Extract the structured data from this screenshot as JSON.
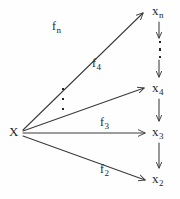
{
  "diagram": {
    "type": "commutative-diagram",
    "stroke_color": "#3a3a3a",
    "text_color": "#262626",
    "background_color": "#fefefe",
    "source_node": {
      "name": "source-node",
      "base": "X",
      "sub": ""
    },
    "target_nodes": [
      {
        "name": "node-xn",
        "base": "x",
        "sub": "n"
      },
      {
        "name": "node-x4",
        "base": "x",
        "sub": "4"
      },
      {
        "name": "node-x3",
        "base": "x",
        "sub": "3"
      },
      {
        "name": "node-x2",
        "base": "x",
        "sub": "2"
      }
    ],
    "edge_labels": [
      {
        "name": "label-fn",
        "base": "f",
        "sub": "n"
      },
      {
        "name": "label-f4",
        "base": "f",
        "sub": "4"
      },
      {
        "name": "label-f3",
        "base": "f",
        "sub": "3"
      },
      {
        "name": "label-f2",
        "base": "f",
        "sub": "2"
      }
    ],
    "ellipses": [
      {
        "name": "fan-ellipsis",
        "orientation": "vertical",
        "dot_count": 3
      },
      {
        "name": "chain-ellipsis",
        "orientation": "vertical",
        "dot_count": 3
      }
    ]
  }
}
